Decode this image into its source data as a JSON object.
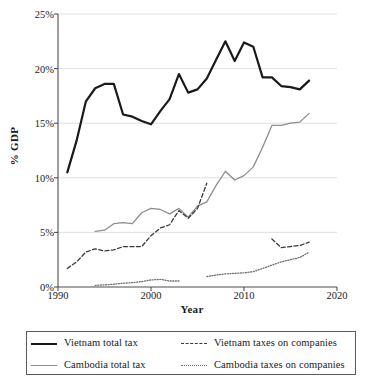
{
  "chart_data": {
    "type": "line",
    "title": "",
    "xlabel": "Year",
    "ylabel": "% GDP",
    "xlim": [
      1990,
      2020
    ],
    "ylim": [
      0,
      25
    ],
    "xticks": [
      "1990",
      "2000",
      "2010",
      "2020"
    ],
    "yticks": [
      "0%",
      "5%",
      "10%",
      "15%",
      "20%",
      "25%"
    ],
    "grid": "horizontal",
    "legend_position": "below-plot",
    "series": [
      {
        "name": "Vietnam total tax",
        "style": "solid-thick-black",
        "color": "#1a1a1a",
        "x": [
          1991,
          1992,
          1993,
          1994,
          1995,
          1996,
          1997,
          1998,
          1999,
          2000,
          2001,
          2002,
          2003,
          2004,
          2005,
          2006,
          2007,
          2008,
          2009,
          2010,
          2011,
          2012,
          2013,
          2014,
          2015,
          2016,
          2017
        ],
        "values": [
          10.5,
          13.4,
          17.0,
          18.2,
          18.6,
          18.6,
          15.8,
          15.6,
          15.2,
          14.9,
          16.1,
          17.2,
          19.5,
          17.8,
          18.1,
          19.1,
          20.8,
          22.5,
          20.7,
          22.4,
          22.0,
          19.2,
          19.2,
          18.4,
          18.3,
          18.1,
          18.9
        ]
      },
      {
        "name": "Cambodia total tax",
        "style": "solid-thin-gray",
        "color": "#8d8d8d",
        "x": [
          1994,
          1995,
          1996,
          1997,
          1998,
          1999,
          2000,
          2001,
          2002,
          2003,
          2004,
          2005,
          2006,
          2007,
          2008,
          2009,
          2010,
          2011,
          2012,
          2013,
          2014,
          2015,
          2016,
          2017
        ],
        "values": [
          5.1,
          5.2,
          5.8,
          5.9,
          5.8,
          6.8,
          7.2,
          7.1,
          6.7,
          7.2,
          6.4,
          7.4,
          7.8,
          9.3,
          10.6,
          9.8,
          10.2,
          11.0,
          12.8,
          14.8,
          14.8,
          15.0,
          15.1,
          15.9
        ]
      },
      {
        "name": "Vietnam taxes on companies",
        "style": "dashed",
        "color": "#3a3a3a",
        "segments": [
          {
            "x": [
              1991,
              1992,
              1993,
              1994,
              1995,
              1996,
              1997,
              1998,
              1999,
              2000,
              2001,
              2002,
              2003,
              2004,
              2005,
              2006
            ],
            "values": [
              1.7,
              2.3,
              3.2,
              3.5,
              3.3,
              3.4,
              3.7,
              3.7,
              3.7,
              4.7,
              5.4,
              5.7,
              7.0,
              6.3,
              7.2,
              9.5
            ]
          },
          {
            "x": [
              2013,
              2014,
              2015,
              2016,
              2017
            ],
            "values": [
              4.4,
              3.6,
              3.7,
              3.8,
              4.1
            ]
          }
        ]
      },
      {
        "name": "Cambodia taxes on companies",
        "style": "dotted",
        "color": "#6e6e6e",
        "segments": [
          {
            "x": [
              1994,
              1995,
              1996,
              1997,
              1998,
              1999,
              2000,
              2001,
              2002,
              2003
            ],
            "values": [
              0.15,
              0.2,
              0.25,
              0.35,
              0.4,
              0.5,
              0.65,
              0.7,
              0.55,
              0.55
            ]
          },
          {
            "x": [
              2006,
              2007,
              2008,
              2009,
              2010,
              2011,
              2012,
              2013,
              2014,
              2015,
              2016,
              2017
            ],
            "values": [
              0.95,
              1.1,
              1.2,
              1.25,
              1.3,
              1.4,
              1.7,
              2.0,
              2.3,
              2.5,
              2.7,
              3.2
            ]
          }
        ]
      }
    ]
  },
  "axes": {
    "ylabel": "% GDP",
    "xlabel": "Year",
    "yticks": [
      "25%",
      "20%",
      "15%",
      "10%",
      "5%",
      "0%"
    ],
    "xticks": [
      "1990",
      "2000",
      "2010",
      "2020"
    ]
  },
  "legend": {
    "items": [
      {
        "label": "Vietnam total tax",
        "icon": "solid-thick-line-icon"
      },
      {
        "label": "Vietnam taxes on companies",
        "icon": "dashed-line-icon"
      },
      {
        "label": "Cambodia total tax",
        "icon": "solid-thin-line-icon"
      },
      {
        "label": "Cambodia taxes on companies",
        "icon": "dotted-line-icon"
      }
    ]
  },
  "colors": {
    "vietnam_total": "#1a1a1a",
    "cambodia_total": "#8d8d8d",
    "vietnam_companies": "#3a3a3a",
    "cambodia_companies": "#6e6e6e",
    "grid": "#d8d8d8",
    "axis": "#4d4d4d"
  }
}
